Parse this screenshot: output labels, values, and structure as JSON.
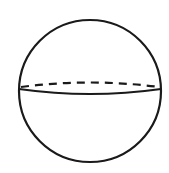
{
  "diagram": {
    "shape": "sphere",
    "outline": {
      "cx": 90,
      "cy": 91,
      "r": 71,
      "stroke": "#1a1a1a",
      "stroke_width": 2.2
    },
    "equator": {
      "front": {
        "style": "solid",
        "path": "M19,89 Q90,99 161,89"
      },
      "back": {
        "style": "dashed",
        "path": "M21,87 Q90,78 159,87"
      }
    },
    "background": "#ffffff"
  }
}
